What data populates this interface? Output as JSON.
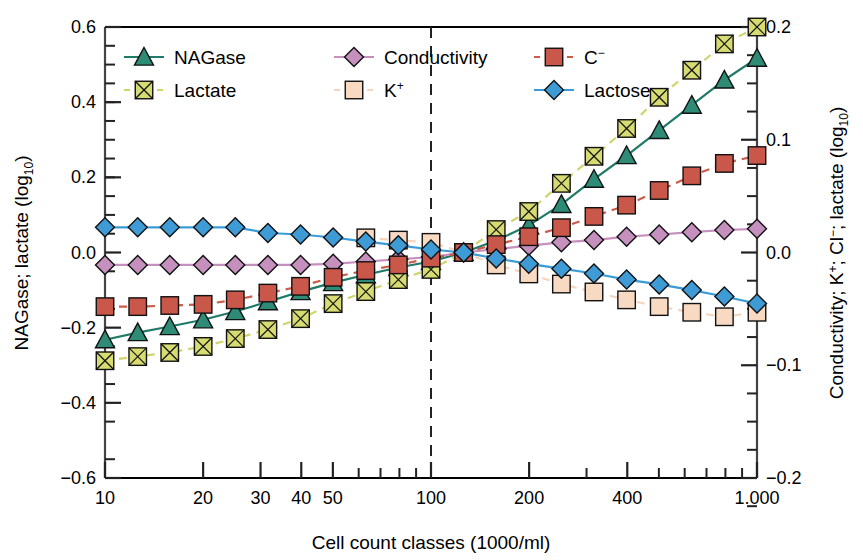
{
  "chart_data": {
    "type": "line",
    "title": "",
    "xlabel": "Cell count classes (1000/ml)",
    "ylabel_left": "NAGase; lactate (log10)",
    "ylabel_right": "Conductivity; K+; Cl-; lactate (log10)",
    "xscale": "log",
    "xlim": [
      10,
      1000
    ],
    "ylim_left": [
      -0.6,
      0.6
    ],
    "ylim_right": [
      -0.2,
      0.2
    ],
    "grid": false,
    "legend_position": "top-inside",
    "xtick_labels": [
      "10",
      "20",
      "30",
      "40",
      "50",
      "100",
      "200",
      "400",
      "1.000"
    ],
    "xtick_values": [
      10,
      20,
      30,
      40,
      50,
      100,
      200,
      400,
      1000
    ],
    "ytick_labels_left": [
      "0.6",
      "0.4",
      "0.2",
      "0.0",
      "-0.2",
      "-0.4",
      "-0.6"
    ],
    "ytick_values_left": [
      0.6,
      0.4,
      0.2,
      0.0,
      -0.2,
      -0.4,
      -0.6
    ],
    "ytick_labels_right": [
      "0.2",
      "0.1",
      "0.0",
      "-0.1",
      "-0.2"
    ],
    "ytick_values_right": [
      0.2,
      0.1,
      0.0,
      -0.1,
      -0.2
    ],
    "annotations": [
      {
        "type": "vline",
        "x": 100,
        "style": "dashed",
        "color": "#222222"
      }
    ],
    "x": [
      10,
      12.6,
      15.8,
      20,
      25.1,
      31.6,
      39.8,
      50.1,
      63.1,
      79.4,
      100,
      125.9,
      158.5,
      199.5,
      251.2,
      316.2,
      398.1,
      501.2,
      631,
      794.3,
      1000
    ],
    "series": [
      {
        "name": "NAGase",
        "axis": "left",
        "color": "#1F7A68",
        "marker": "triangle",
        "marker_face": "#2E8B76",
        "line_style": "solid",
        "values": [
          -0.232,
          -0.213,
          -0.197,
          -0.179,
          -0.157,
          -0.131,
          -0.104,
          -0.08,
          -0.059,
          -0.04,
          -0.024,
          0.0,
          0.032,
          0.072,
          0.128,
          0.195,
          0.258,
          0.325,
          0.392,
          0.459,
          0.517
        ]
      },
      {
        "name": "Lactate",
        "axis": "left",
        "color": "#CFD46B",
        "marker": "square-x",
        "marker_face": "#D6DB72",
        "line_style": "dashed",
        "values": [
          -0.288,
          -0.277,
          -0.266,
          -0.25,
          -0.229,
          -0.205,
          -0.176,
          -0.136,
          -0.104,
          -0.072,
          -0.045,
          0.0,
          0.061,
          0.109,
          0.184,
          0.256,
          0.33,
          0.413,
          0.485,
          0.555,
          0.6
        ]
      },
      {
        "name": "Conductivity",
        "axis": "right",
        "color": "#C58FBE",
        "marker": "diamond",
        "marker_face": "#C58FBE",
        "line_style": "solid",
        "values": [
          -0.011,
          -0.011,
          -0.011,
          -0.011,
          -0.011,
          -0.011,
          -0.011,
          -0.01,
          -0.008,
          -0.006,
          -0.004,
          0.0,
          0.003,
          0.006,
          0.009,
          0.011,
          0.014,
          0.016,
          0.018,
          0.02,
          0.021
        ]
      },
      {
        "name": "K+",
        "axis": "right",
        "color": "#F6D5BE",
        "marker": "square",
        "marker_face": "#F8D9C2",
        "line_style": "dashed",
        "values": [
          null,
          null,
          null,
          null,
          null,
          null,
          null,
          null,
          0.013,
          0.011,
          0.009,
          0.0,
          -0.011,
          -0.019,
          -0.028,
          -0.035,
          -0.042,
          -0.048,
          -0.053,
          -0.057,
          -0.053
        ]
      },
      {
        "name": "Cl-",
        "axis": "right",
        "color": "#CC5B4A",
        "marker": "square",
        "marker_face": "#C9574A",
        "line_style": "dashed",
        "values": [
          -0.048,
          -0.048,
          -0.047,
          -0.046,
          -0.042,
          -0.036,
          -0.03,
          -0.022,
          -0.016,
          -0.011,
          -0.005,
          0.0,
          0.007,
          0.014,
          0.022,
          0.032,
          0.042,
          0.055,
          0.068,
          0.079,
          0.086
        ]
      },
      {
        "name": "Lactose",
        "axis": "left",
        "color": "#3A9BD9",
        "marker": "diamond",
        "marker_face": "#3E9BD6",
        "line_style": "solid",
        "values": [
          0.067,
          0.067,
          0.067,
          0.067,
          0.067,
          0.052,
          0.048,
          0.04,
          0.029,
          0.019,
          0.008,
          0.0,
          -0.016,
          -0.03,
          -0.043,
          -0.056,
          -0.072,
          -0.085,
          -0.1,
          -0.117,
          -0.136
        ]
      }
    ]
  },
  "legend": {
    "entries": [
      {
        "label": "NAGase",
        "marker": "triangle",
        "color": "#2E8B76",
        "line": "#1F7A68",
        "style": "solid"
      },
      {
        "label": "Lactate",
        "marker": "square-x",
        "color": "#D6DB72",
        "line": "#CFD46B",
        "style": "dashed"
      },
      {
        "label": "Conductivity",
        "marker": "diamond",
        "color": "#C58FBE",
        "line": "#C58FBE",
        "style": "solid"
      },
      {
        "label": "K",
        "label_sup": "+",
        "marker": "square",
        "color": "#F8D9C2",
        "line": "#F6D5BE",
        "style": "dashed"
      },
      {
        "label": "C",
        "label_sup": "−",
        "marker": "square",
        "color": "#C9574A",
        "line": "#CC5B4A",
        "style": "dashed"
      },
      {
        "label": "Lactose",
        "marker": "diamond",
        "color": "#3E9BD6",
        "line": "#3A9BD9",
        "style": "solid"
      }
    ]
  },
  "labels": {
    "x_axis_title": "Cell count classes (1000/ml)",
    "y_axis_left_main": "NAGase; lactate (log",
    "y_axis_left_sub": "10",
    "y_axis_left_end": ")",
    "y_axis_right_main": "Conductivity; K",
    "y_axis_right_sup": "+",
    "y_axis_right_mid": "; Cl",
    "y_axis_right_sup2": "−",
    "y_axis_right_rest": "; lactate (log",
    "y_axis_right_sub": "10",
    "y_axis_right_end": ")"
  }
}
